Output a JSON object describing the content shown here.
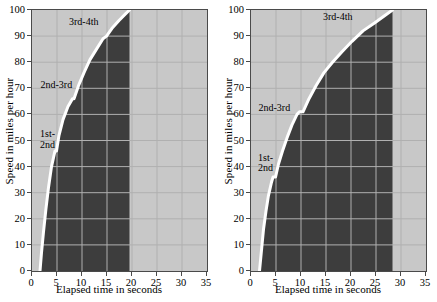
{
  "figure": {
    "background": "#ffffff",
    "dark_fill": "#3d3d3d",
    "light_fill": "#c8c8c8",
    "curve_color": "#ffffff",
    "grid_color": "#b0b0b0",
    "axis_color": "#4a4a4a"
  },
  "charts": [
    {
      "id": "left",
      "ylabel": "Speed in miles per hour",
      "xlabel": "Elapsed time in seconds",
      "yticks": [
        0,
        10,
        20,
        30,
        40,
        50,
        60,
        70,
        80,
        90,
        100
      ],
      "xticks": [
        0,
        5,
        10,
        15,
        20,
        25,
        30,
        35
      ],
      "shift_labels": [
        {
          "text": "1st-\n2nd",
          "x": 1.2,
          "y": 52
        },
        {
          "text": "2nd-3rd",
          "x": 1.3,
          "y": 71
        },
        {
          "text": "3rd-4th",
          "x": 7.0,
          "y": 95
        }
      ],
      "curve": [
        [
          1.6,
          0
        ],
        [
          1.9,
          7
        ],
        [
          2.3,
          15
        ],
        [
          2.8,
          24
        ],
        [
          3.3,
          32
        ],
        [
          3.9,
          40
        ],
        [
          4.6,
          46
        ],
        [
          4.9,
          46
        ],
        [
          5.4,
          52
        ],
        [
          6.2,
          58
        ],
        [
          7.2,
          63
        ],
        [
          8.1,
          66
        ],
        [
          8.4,
          66
        ],
        [
          9.3,
          71
        ],
        [
          10.4,
          76
        ],
        [
          11.6,
          81
        ],
        [
          12.9,
          85
        ],
        [
          14.2,
          89
        ],
        [
          14.9,
          90
        ],
        [
          16.0,
          93
        ],
        [
          17.4,
          96
        ],
        [
          18.7,
          98.5
        ],
        [
          19.5,
          100
        ]
      ],
      "dark_right_edge": 19.5
    },
    {
      "id": "right",
      "ylabel": "Speed in miles per hour",
      "xlabel": "Elapsed time in seconds",
      "yticks": [
        0,
        10,
        20,
        30,
        40,
        50,
        60,
        70,
        80,
        90,
        100
      ],
      "xticks": [
        0,
        5,
        10,
        15,
        20,
        25,
        30,
        35
      ],
      "shift_labels": [
        {
          "text": "1st-\n2nd",
          "x": 1.0,
          "y": 43
        },
        {
          "text": "2nd-3rd",
          "x": 1.1,
          "y": 62
        },
        {
          "text": "3rd-4th",
          "x": 14.0,
          "y": 97
        }
      ],
      "curve": [
        [
          1.7,
          0
        ],
        [
          2.1,
          8
        ],
        [
          2.5,
          16
        ],
        [
          3.0,
          23
        ],
        [
          3.5,
          29
        ],
        [
          4.1,
          34
        ],
        [
          4.4,
          36
        ],
        [
          4.9,
          36
        ],
        [
          5.5,
          41
        ],
        [
          6.3,
          46
        ],
        [
          7.2,
          51
        ],
        [
          8.2,
          56
        ],
        [
          9.2,
          60
        ],
        [
          9.7,
          61
        ],
        [
          10.4,
          61
        ],
        [
          11.6,
          66
        ],
        [
          13.0,
          71
        ],
        [
          14.6,
          76
        ],
        [
          16.3,
          80
        ],
        [
          18.2,
          84
        ],
        [
          20.2,
          88
        ],
        [
          22.4,
          92
        ],
        [
          24.7,
          95
        ],
        [
          26.5,
          97.5
        ],
        [
          28.3,
          100
        ]
      ],
      "dark_right_edge": 28.3
    }
  ]
}
